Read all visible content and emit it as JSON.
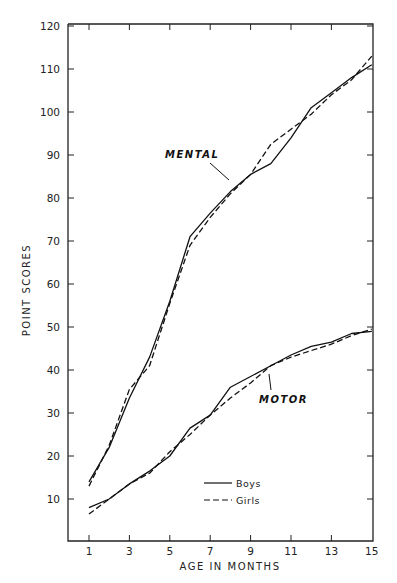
{
  "chart_data": {
    "type": "line",
    "title": "",
    "xlabel": "AGE IN MONTHS",
    "ylabel": "POINT SCORES",
    "x": [
      1,
      2,
      3,
      4,
      5,
      6,
      7,
      8,
      9,
      10,
      11,
      12,
      13,
      14,
      15
    ],
    "xticks": [
      1,
      3,
      5,
      7,
      9,
      11,
      13,
      15
    ],
    "yticks": [
      10,
      20,
      30,
      40,
      50,
      60,
      70,
      80,
      90,
      100,
      110,
      120
    ],
    "xlim": [
      0,
      15
    ],
    "ylim": [
      0,
      120
    ],
    "grid": false,
    "legend_position": "lower right (inside)",
    "series": [
      {
        "name": "Boys - Mental",
        "group": "MENTAL",
        "sex": "Boys",
        "style": "solid",
        "values": [
          14,
          22,
          33.5,
          43,
          56,
          71,
          76.5,
          81.5,
          85.5,
          88,
          94,
          101,
          104.5,
          108,
          111
        ]
      },
      {
        "name": "Girls - Mental",
        "group": "MENTAL",
        "sex": "Girls",
        "style": "dashed",
        "values": [
          13,
          22.5,
          35.5,
          41,
          55.5,
          69,
          75.5,
          81,
          85.5,
          92.5,
          96,
          99.5,
          104,
          107.5,
          113
        ]
      },
      {
        "name": "Boys - Motor",
        "group": "MOTOR",
        "sex": "Boys",
        "style": "solid",
        "values": [
          8,
          10,
          13.5,
          16.5,
          20,
          26.5,
          29.5,
          36,
          38.5,
          41,
          43.5,
          45.5,
          46.5,
          48.5,
          49
        ]
      },
      {
        "name": "Girls - Motor",
        "group": "MOTOR",
        "sex": "Girls",
        "style": "dashed",
        "values": [
          6.5,
          10,
          13.5,
          16,
          21,
          25,
          29.5,
          33.5,
          37,
          41,
          43,
          44.5,
          46,
          48,
          49.5
        ]
      }
    ],
    "annotations": [
      {
        "text": "MENTAL",
        "x": 8,
        "y": 91
      },
      {
        "text": "MOTOR",
        "x": 10,
        "y": 32
      }
    ],
    "legend": [
      {
        "label": "Boys",
        "style": "solid"
      },
      {
        "label": "Girls",
        "style": "dashed"
      }
    ]
  },
  "colors": {
    "line": "#111111",
    "axis": "#222222",
    "background": "#ffffff"
  }
}
